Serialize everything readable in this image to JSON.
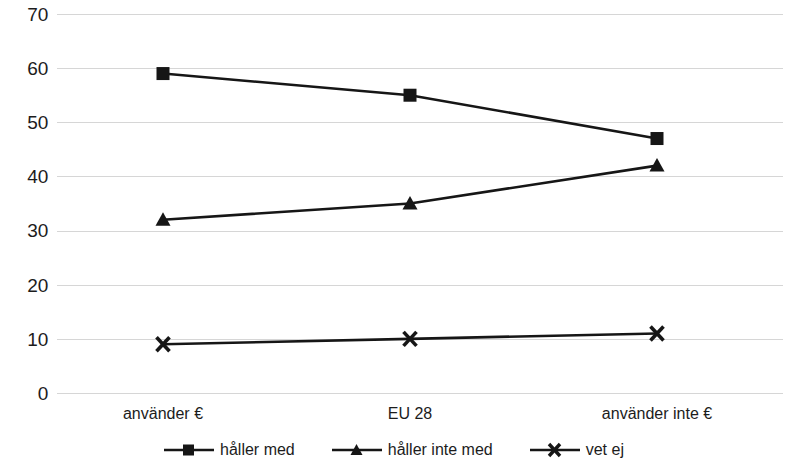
{
  "chart_data": {
    "type": "line",
    "title": "",
    "subtitle": "",
    "xlabel": "",
    "ylabel": "",
    "categories": [
      "använder €",
      "EU 28",
      "använder inte €"
    ],
    "series": [
      {
        "name": "håller med",
        "marker": "square",
        "values": [
          59,
          55,
          47
        ]
      },
      {
        "name": "håller inte med",
        "marker": "triangle",
        "values": [
          32,
          35,
          42
        ]
      },
      {
        "name": "vet ej",
        "marker": "x",
        "values": [
          9,
          10,
          11
        ]
      }
    ],
    "ylim": [
      0,
      70
    ],
    "yticks": [
      0,
      10,
      20,
      30,
      40,
      50,
      60,
      70
    ],
    "ytick_labels": [
      "0",
      "10",
      "20",
      "30",
      "40",
      "50",
      "60",
      "70"
    ],
    "grid": true,
    "grid_color": "#d6d6d6",
    "legend_position": "bottom",
    "line_color": "#161616",
    "background": "#ffffff"
  },
  "axis": {
    "y": {
      "t0": "70",
      "t1": "60",
      "t2": "50",
      "t3": "40",
      "t4": "30",
      "t5": "20",
      "t6": "10",
      "t7": "0"
    },
    "x": {
      "c0": "använder €",
      "c1": "EU 28",
      "c2": "använder inte €"
    }
  },
  "legend": {
    "items": [
      {
        "label": "håller med",
        "icon": "square-marker-icon"
      },
      {
        "label": "håller inte med",
        "icon": "triangle-marker-icon"
      },
      {
        "label": "vet ej",
        "icon": "x-marker-icon"
      }
    ]
  }
}
